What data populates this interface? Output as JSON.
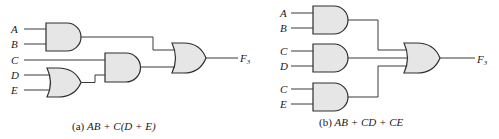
{
  "diagrams": [
    {
      "id": "a",
      "caption_prefix": "(a) ",
      "caption_expr": "AB + C(D + E)",
      "inputs": [
        "A",
        "B",
        "C",
        "D",
        "E"
      ],
      "output_label": "F",
      "output_subscript": "3",
      "gates": [
        {
          "name": "and-gate-ab",
          "type": "AND",
          "inputs": [
            "A",
            "B"
          ]
        },
        {
          "name": "or-gate-de",
          "type": "OR",
          "inputs": [
            "D",
            "E"
          ]
        },
        {
          "name": "and-gate-c-de",
          "type": "AND",
          "inputs": [
            "C",
            "D+E"
          ]
        },
        {
          "name": "or-gate-output",
          "type": "OR",
          "inputs": [
            "AB",
            "C(D+E)"
          ]
        }
      ]
    },
    {
      "id": "b",
      "caption_prefix": "(b) ",
      "caption_expr": "AB + CD + CE",
      "inputs": [
        "A",
        "B",
        "C",
        "D",
        "C",
        "E"
      ],
      "output_label": "F",
      "output_subscript": "3",
      "gates": [
        {
          "name": "and-gate-ab",
          "type": "AND",
          "inputs": [
            "A",
            "B"
          ]
        },
        {
          "name": "and-gate-cd",
          "type": "AND",
          "inputs": [
            "C",
            "D"
          ]
        },
        {
          "name": "and-gate-ce",
          "type": "AND",
          "inputs": [
            "C",
            "E"
          ]
        },
        {
          "name": "or-gate-output",
          "type": "OR",
          "inputs": [
            "AB",
            "CD",
            "CE"
          ]
        }
      ]
    }
  ],
  "colors": {
    "gate_fill": "#e6e6e6",
    "stroke": "#2e2e2e",
    "background": "#ffffff"
  }
}
